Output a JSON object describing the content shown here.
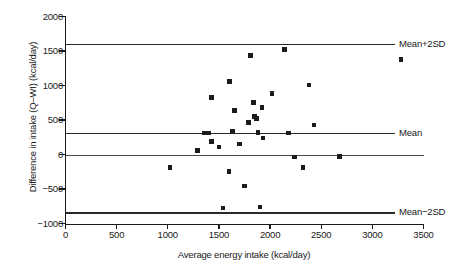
{
  "chart_data": {
    "type": "scatter",
    "title": "",
    "xlabel": "Average energy intake (kcal/day)",
    "ylabel": "Difference in intake (Q–WI) (kcal/day)",
    "xlim": [
      0,
      3500
    ],
    "ylim": [
      -1000,
      2000
    ],
    "xticks": [
      0,
      500,
      1000,
      1500,
      2000,
      2500,
      3000,
      3500
    ],
    "yticks": [
      -1000,
      -500,
      0,
      500,
      1000,
      1500,
      2000
    ],
    "grid": false,
    "legend": "none",
    "reference_lines": [
      {
        "label": "Mean+2SD",
        "value": 1600
      },
      {
        "label": "Mean",
        "value": 310
      },
      {
        "label": "Mean−2SD",
        "value": -840
      }
    ],
    "zero_line": 0,
    "points": [
      {
        "x": 1020,
        "y": -185
      },
      {
        "x": 1290,
        "y": 60
      },
      {
        "x": 1355,
        "y": 310
      },
      {
        "x": 1400,
        "y": 310
      },
      {
        "x": 1425,
        "y": 190
      },
      {
        "x": 1430,
        "y": 830
      },
      {
        "x": 1500,
        "y": 110
      },
      {
        "x": 1540,
        "y": -775
      },
      {
        "x": 1600,
        "y": -250
      },
      {
        "x": 1605,
        "y": 1060
      },
      {
        "x": 1630,
        "y": 330
      },
      {
        "x": 1655,
        "y": 640
      },
      {
        "x": 1700,
        "y": 155
      },
      {
        "x": 1750,
        "y": -455
      },
      {
        "x": 1790,
        "y": 460
      },
      {
        "x": 1810,
        "y": 1435
      },
      {
        "x": 1840,
        "y": 750
      },
      {
        "x": 1850,
        "y": 550
      },
      {
        "x": 1870,
        "y": 525
      },
      {
        "x": 1880,
        "y": 315
      },
      {
        "x": 1900,
        "y": -760
      },
      {
        "x": 1920,
        "y": 685
      },
      {
        "x": 1930,
        "y": 240
      },
      {
        "x": 2020,
        "y": 880
      },
      {
        "x": 2140,
        "y": 1520
      },
      {
        "x": 2180,
        "y": 310
      },
      {
        "x": 2240,
        "y": -35
      },
      {
        "x": 2320,
        "y": -185
      },
      {
        "x": 2380,
        "y": 1010
      },
      {
        "x": 2430,
        "y": 430
      },
      {
        "x": 2680,
        "y": -30
      },
      {
        "x": 3280,
        "y": 1375
      }
    ]
  }
}
